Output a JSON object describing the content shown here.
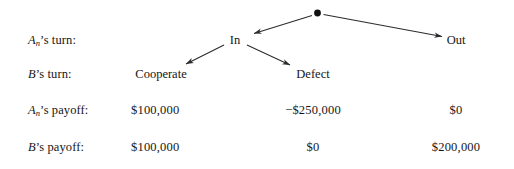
{
  "figure": {
    "type": "extensive-form-game-tree",
    "root_node": "decision-node",
    "rows": [
      {
        "id": "a-turn",
        "label_a": "A",
        "label_sub": "n",
        "label_rest": "’s turn:"
      },
      {
        "id": "b-turn",
        "label_a": "B",
        "label_sub": "",
        "label_rest": "’s turn:"
      },
      {
        "id": "a-payoff",
        "label_a": "A",
        "label_sub": "n",
        "label_rest": "’s payoff:"
      },
      {
        "id": "b-payoff",
        "label_a": "B",
        "label_sub": "",
        "label_rest": "’s payoff:"
      }
    ],
    "branches": {
      "in": "In",
      "out": "Out",
      "cooperate": "Cooperate",
      "defect": "Defect"
    },
    "payoffs": {
      "a": {
        "cooperate": "$100,000",
        "defect": "−$250,000",
        "out": "$0"
      },
      "b": {
        "cooperate": "$100,000",
        "defect": "$0",
        "out": "$200,000"
      }
    },
    "colors": {
      "ink": "#161616",
      "line": "#2b2b2b",
      "background": "#ffffff"
    }
  }
}
